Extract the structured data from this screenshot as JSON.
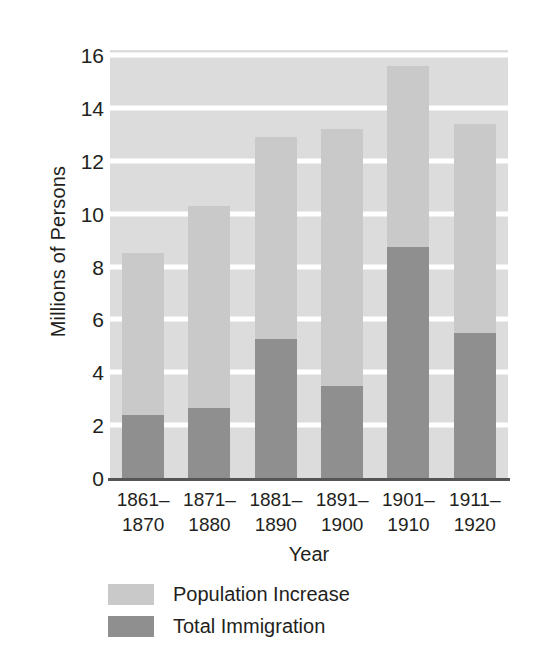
{
  "chart_data": {
    "type": "bar",
    "subtype": "stacked-bar",
    "title": "",
    "xlabel": "Year",
    "ylabel": "Millions of Persons",
    "categories": [
      "1861–1870",
      "1871–1880",
      "1881–1890",
      "1891–1900",
      "1901–1910",
      "1911–1920"
    ],
    "category_lines": [
      [
        "1861–",
        "1870"
      ],
      [
        "1871–",
        "1880"
      ],
      [
        "1881–",
        "1890"
      ],
      [
        "1891–",
        "1900"
      ],
      [
        "1901–",
        "1910"
      ],
      [
        "1911–",
        "1920"
      ]
    ],
    "series": [
      {
        "name": "Total Immigration",
        "color": "#8f8f8f",
        "values": [
          2.4,
          2.65,
          5.25,
          3.5,
          8.75,
          5.5
        ]
      },
      {
        "name": "Population Increase",
        "color": "#c9c9c9",
        "values": [
          6.1,
          7.65,
          7.65,
          9.7,
          6.85,
          7.9
        ]
      }
    ],
    "totals": [
      8.5,
      10.3,
      12.9,
      13.2,
      15.6,
      13.4
    ],
    "stacking": "bottom-to-top: Total Immigration then Population Increase",
    "ylim": [
      0,
      16.2
    ],
    "yticks": [
      0,
      2,
      4,
      6,
      8,
      10,
      12,
      14,
      16
    ],
    "ytick_labels": [
      "0",
      "2",
      "4",
      "6",
      "8",
      "10",
      "12",
      "14",
      "16"
    ],
    "grid": "horizontal white gridlines on gray plot background",
    "legend_position": "below-axis-left",
    "legend": [
      {
        "label": "Population Increase",
        "color": "#c9c9c9"
      },
      {
        "label": "Total Immigration",
        "color": "#8f8f8f"
      }
    ]
  }
}
